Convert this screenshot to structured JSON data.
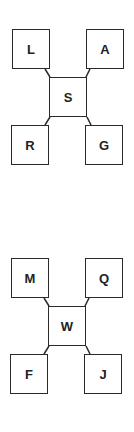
{
  "diagrams": [
    {
      "center": "S",
      "top_left": "L",
      "top_right": "A",
      "bottom_left": "R",
      "bottom_right": "G"
    },
    {
      "center": "W",
      "top_left": "M",
      "top_right": "Q",
      "bottom_left": "F",
      "bottom_right": "J"
    }
  ],
  "colors": {
    "stroke": "#2a2a2a",
    "text": "#222222",
    "background": "#ffffff"
  }
}
